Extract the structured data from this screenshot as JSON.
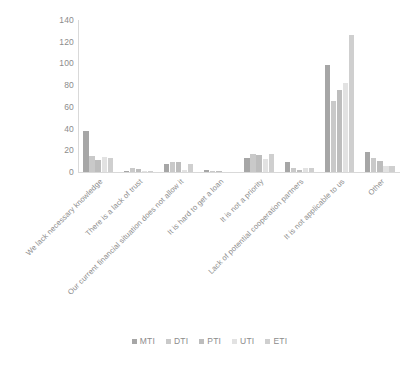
{
  "chart_data": {
    "type": "bar",
    "title": "",
    "subtitle": "",
    "xlabel": "",
    "ylabel": "",
    "ylim": [
      0,
      140
    ],
    "ytick_labels": [
      "0",
      "20",
      "40",
      "60",
      "80",
      "100",
      "120",
      "140"
    ],
    "ytick_values": [
      0,
      20,
      40,
      60,
      80,
      100,
      120,
      140
    ],
    "grid": false,
    "legend_position": "bottom-center",
    "categories": [
      "We lack necessary knowledge",
      "There is a lack of trust",
      "Our current financial situation does not allow it",
      "It is hard to get a loan",
      "It is not a priority",
      "Lack of potential cooperation partners",
      "It is not applicable to us",
      "Other"
    ],
    "series": [
      {
        "name": "MTI",
        "color": "#a6a6a6",
        "values": [
          38,
          1,
          7,
          2,
          13,
          9,
          99,
          18
        ]
      },
      {
        "name": "DTI",
        "color": "#c9c9c9",
        "values": [
          15,
          4,
          9,
          1,
          17,
          4,
          65,
          13
        ]
      },
      {
        "name": "PTI",
        "color": "#bdbdbd",
        "values": [
          11,
          3,
          9,
          1,
          16,
          2,
          76,
          10
        ]
      },
      {
        "name": "UTI",
        "color": "#e2e2e2",
        "values": [
          14,
          1,
          2,
          0,
          12,
          4,
          82,
          6
        ]
      },
      {
        "name": "ETI",
        "color": "#cfcfcf",
        "values": [
          13,
          1,
          7,
          0,
          17,
          4,
          126,
          6
        ]
      }
    ],
    "colors": {
      "axis_line": "#d9d9d9",
      "tick_text": "#8c8c8c",
      "background": "#ffffff"
    }
  },
  "legend": {
    "items": [
      {
        "label": "MTI"
      },
      {
        "label": "DTI"
      },
      {
        "label": "PTI"
      },
      {
        "label": "UTI"
      },
      {
        "label": "ETI"
      }
    ]
  }
}
